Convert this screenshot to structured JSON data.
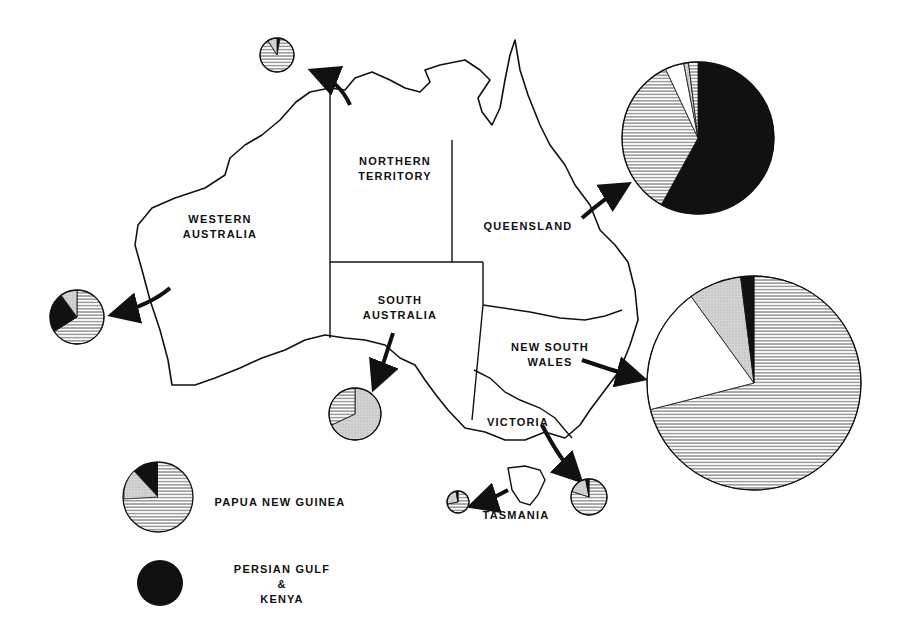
{
  "map": {
    "title": "Australia",
    "regions": [
      {
        "id": "wa",
        "label": "WESTERN\nAUSTRALIA"
      },
      {
        "id": "nt",
        "label": "NORTHERN\nTERRITORY"
      },
      {
        "id": "qld",
        "label": "QUEENSLAND"
      },
      {
        "id": "sa",
        "label": "SOUTH\nAUSTRALIA"
      },
      {
        "id": "nsw",
        "label": "NEW SOUTH\nWALES"
      },
      {
        "id": "vic",
        "label": "VICTORIA"
      },
      {
        "id": "tas",
        "label": "TASMANIA"
      }
    ]
  },
  "legend": {
    "items": [
      {
        "label": "PAPUA NEW GUINEA",
        "pattern": "hatched"
      },
      {
        "label": "PERSIAN GULF\n&\nKENYA",
        "pattern": "solid-black"
      }
    ]
  },
  "chart_data": {
    "type": "pie",
    "title": "",
    "note": "Pie charts per region; slice values estimated from angles (percent). Size indicates relative magnitude.",
    "slice_patterns": {
      "hatched": "horizontal lines",
      "stippled": "grey dotted",
      "white": "plain white",
      "black": "solid black"
    },
    "pies": [
      {
        "region": "Northern Territory",
        "cx": 277,
        "cy": 55,
        "r": 17,
        "slices": [
          {
            "pattern": "black",
            "value": 3
          },
          {
            "pattern": "hatched",
            "value": 88
          },
          {
            "pattern": "stippled",
            "value": 9
          }
        ]
      },
      {
        "region": "Queensland",
        "cx": 698,
        "cy": 138,
        "r": 76,
        "slices": [
          {
            "pattern": "black",
            "value": 58
          },
          {
            "pattern": "hatched",
            "value": 35
          },
          {
            "pattern": "white",
            "value": 4
          },
          {
            "pattern": "stippled",
            "value": 1
          },
          {
            "pattern": "hatched",
            "value": 2
          }
        ]
      },
      {
        "region": "Western Australia",
        "cx": 77,
        "cy": 317,
        "r": 27,
        "slices": [
          {
            "pattern": "hatched",
            "value": 66
          },
          {
            "pattern": "black",
            "value": 24
          },
          {
            "pattern": "stippled",
            "value": 10
          }
        ]
      },
      {
        "region": "South Australia",
        "cx": 355,
        "cy": 414,
        "r": 26,
        "slices": [
          {
            "pattern": "stippled",
            "value": 68
          },
          {
            "pattern": "hatched",
            "value": 32
          }
        ]
      },
      {
        "region": "New South Wales",
        "cx": 754,
        "cy": 383,
        "r": 107,
        "slices": [
          {
            "pattern": "hatched",
            "value": 71
          },
          {
            "pattern": "white",
            "value": 19
          },
          {
            "pattern": "stippled",
            "value": 8
          },
          {
            "pattern": "black",
            "value": 2
          }
        ]
      },
      {
        "region": "Victoria",
        "cx": 589,
        "cy": 497,
        "r": 18,
        "slices": [
          {
            "pattern": "hatched",
            "value": 80
          },
          {
            "pattern": "stippled",
            "value": 17
          },
          {
            "pattern": "black",
            "value": 3
          }
        ]
      },
      {
        "region": "Tasmania",
        "cx": 458,
        "cy": 502,
        "r": 11,
        "slices": [
          {
            "pattern": "hatched",
            "value": 72
          },
          {
            "pattern": "stippled",
            "value": 25
          },
          {
            "pattern": "black",
            "value": 3
          }
        ]
      }
    ],
    "legend": [
      {
        "label": "Papua New Guinea",
        "pattern": "hatched pie (sample)"
      },
      {
        "label": "Persian Gulf & Kenya",
        "pattern": "solid black"
      }
    ]
  }
}
